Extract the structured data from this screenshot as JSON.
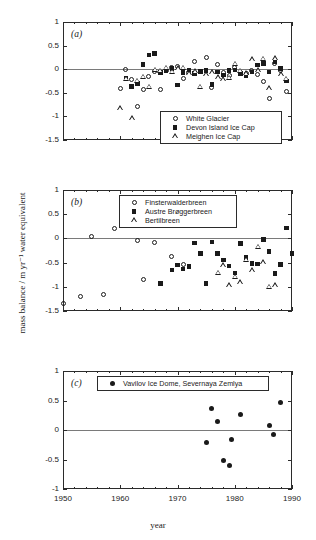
{
  "figure": {
    "xlabel": "year",
    "ylabel": "mass balance / m yr⁻¹ water equivalent"
  },
  "panels": {
    "a": {
      "letter": "(a)",
      "ylim": [
        -1.5,
        1
      ],
      "yticks": [
        "1",
        "0.5",
        "0",
        "-0.5",
        "-1",
        "-1.5"
      ],
      "legend": [
        {
          "label": "White Glacier",
          "marker": "open-circle"
        },
        {
          "label": "Devon Island Ice Cap",
          "marker": "filled-square"
        },
        {
          "label": "Meighen Ice Cap",
          "marker": "open-triangle"
        }
      ]
    },
    "b": {
      "letter": "(b)",
      "ylim": [
        -1.5,
        1
      ],
      "yticks": [
        "1",
        "0.5",
        "0",
        "-0.5",
        "-1",
        "-1.5"
      ],
      "legend": [
        {
          "label": "Finsterwalderbreen",
          "marker": "open-circle"
        },
        {
          "label": "Austre Brøggerbreen",
          "marker": "filled-square"
        },
        {
          "label": "Bertilbreen",
          "marker": "open-triangle"
        }
      ]
    },
    "c": {
      "letter": "(c)",
      "ylim": [
        -1,
        1
      ],
      "yticks": [
        "1",
        "0.5",
        "0",
        "-0.5",
        "-1"
      ],
      "legend": [
        {
          "label": "Vavilov Ice Dome, Severnaya Zemlya",
          "marker": "filled-circle"
        }
      ]
    }
  },
  "xaxis": {
    "ticks": [
      "1950",
      "1960",
      "1970",
      "1980",
      "1990"
    ],
    "xlim": [
      1950,
      1990
    ]
  },
  "chart_data": [
    {
      "type": "scatter",
      "panel": "a",
      "title": "(a)",
      "xlabel": "year",
      "ylabel": "mass balance / m yr-1 water equivalent",
      "xlim": [
        1950,
        1990
      ],
      "ylim": [
        -1.5,
        1
      ],
      "grid": false,
      "legend_position": "bottom-right-inside",
      "series": [
        {
          "name": "White Glacier",
          "marker": "open-circle",
          "points": [
            [
              1960.0,
              -0.41
            ],
            [
              1961.0,
              0.0
            ],
            [
              1962.0,
              -0.22
            ],
            [
              1963.0,
              -0.79
            ],
            [
              1964.0,
              -0.43
            ],
            [
              1965.0,
              -0.15
            ],
            [
              1966.0,
              -0.05
            ],
            [
              1967.0,
              -0.42
            ],
            [
              1968.0,
              -0.02
            ],
            [
              1969.0,
              0.04
            ],
            [
              1970.0,
              0.05
            ],
            [
              1971.0,
              -0.19
            ],
            [
              1972.0,
              -0.06
            ],
            [
              1973.0,
              0.16
            ],
            [
              1974.0,
              -0.04
            ],
            [
              1975.0,
              0.24
            ],
            [
              1976.0,
              -0.38
            ],
            [
              1977.0,
              0.1
            ],
            [
              1978.0,
              -0.08
            ],
            [
              1979.0,
              -0.13
            ],
            [
              1980.0,
              0.04
            ],
            [
              1981.0,
              -0.07
            ],
            [
              1982.0,
              -0.1
            ],
            [
              1983.0,
              -0.02
            ],
            [
              1984.0,
              -0.11
            ],
            [
              1985.0,
              -0.25
            ],
            [
              1986.0,
              -0.62
            ],
            [
              1987.0,
              0.12
            ],
            [
              1988.0,
              -0.02
            ],
            [
              1989.0,
              -0.47
            ]
          ]
        },
        {
          "name": "Devon Island Ice Cap",
          "marker": "filled-square",
          "points": [
            [
              1961.0,
              -0.2
            ],
            [
              1962.0,
              -0.37
            ],
            [
              1963.0,
              -0.3
            ],
            [
              1964.0,
              0.1
            ],
            [
              1965.0,
              0.3
            ],
            [
              1966.0,
              0.33
            ],
            [
              1967.0,
              -0.07
            ],
            [
              1968.0,
              -0.04
            ],
            [
              1969.0,
              0.01
            ],
            [
              1970.0,
              -0.34
            ],
            [
              1971.0,
              -0.07
            ],
            [
              1972.0,
              -0.02
            ],
            [
              1973.0,
              -0.09
            ],
            [
              1974.0,
              -0.05
            ],
            [
              1975.0,
              -0.03
            ],
            [
              1976.0,
              -0.32
            ],
            [
              1977.0,
              -0.06
            ],
            [
              1978.0,
              -0.12
            ],
            [
              1979.0,
              -0.03
            ],
            [
              1980.0,
              -0.02
            ],
            [
              1981.0,
              -0.09
            ],
            [
              1982.0,
              -0.13
            ],
            [
              1983.0,
              -0.06
            ],
            [
              1984.0,
              0.09
            ],
            [
              1985.0,
              0.12
            ],
            [
              1986.0,
              -0.06
            ],
            [
              1987.0,
              0.16
            ],
            [
              1988.0,
              0.02
            ],
            [
              1989.0,
              -0.25
            ]
          ]
        },
        {
          "name": "Meighen Ice Cap",
          "marker": "open-triangle",
          "points": [
            [
              1960.0,
              -0.83
            ],
            [
              1961.0,
              -0.21
            ],
            [
              1962.0,
              -1.05
            ],
            [
              1963.0,
              -0.25
            ],
            [
              1964.0,
              -0.17
            ],
            [
              1965.0,
              -0.38
            ],
            [
              1966.0,
              -0.02
            ],
            [
              1967.0,
              -0.04
            ],
            [
              1968.0,
              0.02
            ],
            [
              1969.0,
              -0.06
            ],
            [
              1970.0,
              0.01
            ],
            [
              1971.0,
              0.02
            ],
            [
              1972.0,
              -0.09
            ],
            [
              1973.0,
              -0.05
            ],
            [
              1974.0,
              -0.38
            ],
            [
              1975.0,
              -0.11
            ],
            [
              1976.0,
              -0.07
            ],
            [
              1977.0,
              -0.18
            ],
            [
              1978.0,
              -0.22
            ],
            [
              1979.0,
              -0.19
            ],
            [
              1980.0,
              0.11
            ],
            [
              1981.0,
              -0.04
            ],
            [
              1982.0,
              -0.1
            ],
            [
              1983.0,
              0.2
            ],
            [
              1984.0,
              -0.03
            ],
            [
              1985.0,
              0.21
            ],
            [
              1986.0,
              -0.41
            ],
            [
              1987.0,
              0.22
            ],
            [
              1988.0,
              -0.12
            ],
            [
              1989.0,
              -0.21
            ]
          ]
        }
      ]
    },
    {
      "type": "scatter",
      "panel": "b",
      "title": "(b)",
      "xlabel": "year",
      "ylabel": "mass balance / m yr-1 water equivalent",
      "xlim": [
        1950,
        1990
      ],
      "ylim": [
        -1.5,
        1
      ],
      "grid": false,
      "legend_position": "top-center-inside",
      "series": [
        {
          "name": "Finsterwalderbreen",
          "marker": "open-circle",
          "points": [
            [
              1950.0,
              -1.35
            ],
            [
              1953.0,
              -1.2
            ],
            [
              1955.0,
              0.04
            ],
            [
              1957.0,
              -1.15
            ],
            [
              1959.0,
              0.2
            ],
            [
              1963.0,
              -0.04
            ],
            [
              1964.0,
              -0.85
            ],
            [
              1966.0,
              -0.09
            ],
            [
              1969.0,
              -0.38
            ],
            [
              1971.0,
              -0.54
            ]
          ]
        },
        {
          "name": "Austre Brøggerbreen",
          "marker": "filled-square",
          "points": [
            [
              1967.0,
              -0.93
            ],
            [
              1969.0,
              -0.65
            ],
            [
              1970.0,
              -0.55
            ],
            [
              1971.0,
              -0.63
            ],
            [
              1972.0,
              -0.58
            ],
            [
              1973.0,
              -0.1
            ],
            [
              1974.0,
              -0.31
            ],
            [
              1975.0,
              -0.93
            ],
            [
              1976.0,
              -0.07
            ],
            [
              1977.0,
              -0.31
            ],
            [
              1978.0,
              -0.45
            ],
            [
              1979.0,
              -0.57
            ],
            [
              1980.0,
              -0.71
            ],
            [
              1981.0,
              -0.11
            ],
            [
              1982.0,
              -0.39
            ],
            [
              1983.0,
              -0.52
            ],
            [
              1984.0,
              -0.53
            ],
            [
              1985.0,
              -0.02
            ],
            [
              1986.0,
              -0.27
            ],
            [
              1987.0,
              -0.73
            ],
            [
              1988.0,
              -0.54
            ],
            [
              1989.0,
              0.22
            ],
            [
              1990.0,
              -0.31
            ]
          ]
        },
        {
          "name": "Bertilbreen",
          "marker": "open-triangle",
          "points": [
            [
              1977.0,
              -0.72
            ],
            [
              1978.0,
              -0.57
            ],
            [
              1979.0,
              -0.98
            ],
            [
              1980.0,
              -0.8
            ],
            [
              1981.0,
              -0.92
            ],
            [
              1982.0,
              -0.45
            ],
            [
              1983.0,
              -0.67
            ],
            [
              1984.0,
              -0.18
            ],
            [
              1985.0,
              -0.5
            ],
            [
              1986.0,
              -1.01
            ],
            [
              1987.0,
              -0.97
            ]
          ]
        }
      ]
    },
    {
      "type": "scatter",
      "panel": "c",
      "title": "(c)",
      "xlabel": "year",
      "ylabel": "mass balance / m yr-1 water equivalent",
      "xlim": [
        1950,
        1990
      ],
      "ylim": [
        -1,
        1
      ],
      "grid": false,
      "legend_position": "top-center-inside",
      "series": [
        {
          "name": "Vavilov Ice Dome, Severnaya Zemlya",
          "marker": "filled-circle",
          "points": [
            [
              1975.0,
              -0.21
            ],
            [
              1976.0,
              0.36
            ],
            [
              1977.0,
              0.15
            ],
            [
              1978.0,
              -0.52
            ],
            [
              1979.0,
              -0.6
            ],
            [
              1979.5,
              -0.16
            ],
            [
              1981.0,
              0.26
            ],
            [
              1986.0,
              0.07
            ],
            [
              1986.8,
              -0.07
            ],
            [
              1988.0,
              0.47
            ]
          ]
        }
      ]
    }
  ]
}
